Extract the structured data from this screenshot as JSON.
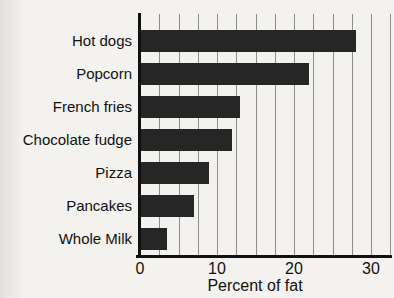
{
  "chart_data": {
    "type": "bar",
    "orientation": "horizontal",
    "title": "",
    "xlabel": "Percent of fat",
    "ylabel": "",
    "categories": [
      "Hot dogs",
      "Popcorn",
      "French fries",
      "Chocolate fudge",
      "Pizza",
      "Pancakes",
      "Whole Milk"
    ],
    "values": [
      28,
      22,
      13,
      12,
      9,
      7,
      3.5
    ],
    "xlim": [
      0,
      33
    ],
    "xticks": [
      0,
      10,
      20,
      30
    ],
    "gridline_interval": 2.5,
    "grid": true,
    "legend": false,
    "colors": {
      "bar": "#262626",
      "axis": "#111111",
      "gridline": "#8c8c8c",
      "background": "#f3f2ef",
      "text": "#111111"
    }
  }
}
